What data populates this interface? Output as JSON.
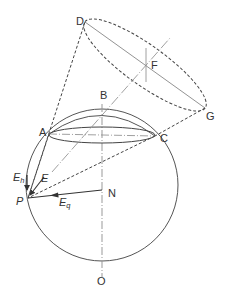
{
  "diagram": {
    "type": "geometric-construction",
    "colors": {
      "stroke": "#444444",
      "dashed": "#444444",
      "axis": "#888888",
      "text": "#333333",
      "background": "#ffffff"
    },
    "points": {
      "A": {
        "label": "A",
        "x": 49,
        "y": 134
      },
      "B": {
        "label": "B",
        "x": 102,
        "y": 95
      },
      "C": {
        "label": "C",
        "x": 155,
        "y": 136
      },
      "D": {
        "label": "D",
        "x": 85,
        "y": 22
      },
      "F": {
        "label": "F",
        "x": 146,
        "y": 65
      },
      "G": {
        "label": "G",
        "x": 205,
        "y": 108
      },
      "N": {
        "label": "N",
        "x": 102,
        "y": 190
      },
      "O": {
        "label": "O",
        "x": 102,
        "y": 281
      },
      "P": {
        "label": "P",
        "x": 28,
        "y": 198
      }
    },
    "vectors": {
      "E": {
        "label": "E",
        "main": "E",
        "sub": ""
      },
      "Eh": {
        "label": "Eh",
        "main": "E",
        "sub": "h"
      },
      "Eq": {
        "label": "Eq",
        "main": "E",
        "sub": "q"
      }
    }
  }
}
